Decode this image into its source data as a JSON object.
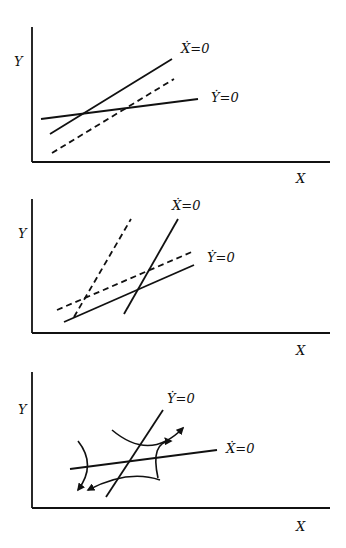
{
  "figure": {
    "panels": [
      {
        "id": "panel-1",
        "y_label": "Y",
        "x_label": "X",
        "xdot_label": "Ẋ=0",
        "ydot_label": "Ẏ=0"
      },
      {
        "id": "panel-2",
        "y_label": "Y",
        "x_label": "X",
        "xdot_label": "Ẋ=0",
        "ydot_label": "Ẏ=0"
      },
      {
        "id": "panel-3",
        "y_label": "Y",
        "x_label": "X",
        "xdot_label": "Ẋ=0",
        "ydot_label": "Ẏ=0"
      }
    ],
    "colors": {
      "ink": "#111111",
      "background": "#ffffff"
    }
  }
}
